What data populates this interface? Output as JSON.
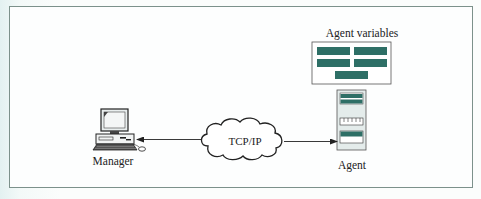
{
  "diagram": {
    "type": "network-management",
    "nodes": {
      "manager": {
        "label": "Manager",
        "icon": "desktop-computer-icon"
      },
      "network": {
        "label": "TCP/IP",
        "icon": "cloud-icon"
      },
      "agent": {
        "label": "Agent",
        "icon": "server-tower-icon"
      },
      "agent_variables": {
        "label": "Agent variables",
        "icon": "variables-table-icon",
        "bars": 5
      }
    },
    "edges": [
      {
        "from": "network",
        "to": "manager",
        "style": "arrow"
      },
      {
        "from": "network",
        "to": "agent",
        "style": "arrow"
      }
    ],
    "colors": {
      "frame_border": "#7c918b",
      "teal_bar": "#2e6f66",
      "server_body": "#e4eceb",
      "line": "#222222"
    }
  }
}
